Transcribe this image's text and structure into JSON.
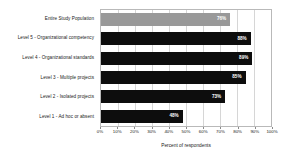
{
  "chart_data": {
    "type": "bar",
    "orientation": "horizontal",
    "title": "",
    "xlabel": "Percent of respondents",
    "ylabel": "",
    "xlim": [
      0,
      100
    ],
    "xticks": [
      "0%",
      "10%",
      "20%",
      "30%",
      "40%",
      "50%",
      "60%",
      "70%",
      "80%",
      "90%",
      "100%"
    ],
    "grid": true,
    "legend": "none",
    "categories": [
      "Entire Study Population",
      "Level 5 - Organizational competency",
      "Level 4 - Organizational standards",
      "Level 3 - Multiple projects",
      "Level 2 - Isolated projects",
      "Level 1 - Ad hoc or absent"
    ],
    "values": [
      76,
      88,
      89,
      85,
      73,
      48
    ],
    "value_labels": [
      "76%",
      "88%",
      "89%",
      "85%",
      "73%",
      "48%"
    ],
    "bar_colors": [
      "#999999",
      "#0d0d0d",
      "#0d0d0d",
      "#0d0d0d",
      "#0d0d0d",
      "#0d0d0d"
    ]
  }
}
